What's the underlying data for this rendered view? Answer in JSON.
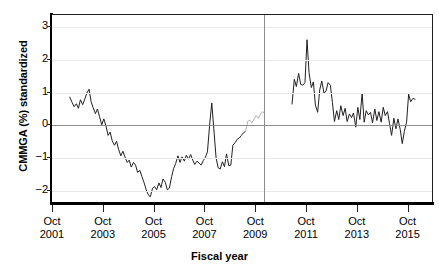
{
  "chart_data": {
    "type": "line",
    "title": "",
    "xlabel": "Fiscal year",
    "ylabel": "CMMGA (%) standardized",
    "grid": true,
    "legend": false,
    "xlim": [
      2001.0,
      2016.0
    ],
    "ylim": [
      -2.35,
      3.35
    ],
    "yticks": [
      -2,
      -1,
      0,
      1,
      2,
      3
    ],
    "ytick_labels": [
      "−2",
      "−1",
      "0",
      "1",
      "2",
      "3"
    ],
    "xticks": [
      2001,
      2003,
      2005,
      2007,
      2009,
      2011,
      2013,
      2015
    ],
    "xtick_labels": [
      {
        "month": "Oct",
        "year": "2001"
      },
      {
        "month": "Oct",
        "year": "2003"
      },
      {
        "month": "Oct",
        "year": "2005"
      },
      {
        "month": "Oct",
        "year": "2007"
      },
      {
        "month": "Oct",
        "year": "2009"
      },
      {
        "month": "Oct",
        "year": "2011"
      },
      {
        "month": "Oct",
        "year": "2013"
      },
      {
        "month": "Oct",
        "year": "2015"
      }
    ],
    "annotations": [
      {
        "name": "interruption-line",
        "type": "vline",
        "x": 2009.35,
        "color": "#8c8c8c"
      }
    ],
    "colors": {
      "series": "#231f20",
      "series_faded": "#b0b0b0",
      "gridline": "#e8e8e8",
      "zero_line": "#8c8c8c",
      "reference_line": "#8c8c8c",
      "axis": "#000000",
      "background": "#ffffff"
    },
    "series": [
      {
        "name": "CMMGA standardized (pre-intervention)",
        "color": "#231f20",
        "x": [
          2001.7,
          2001.79,
          2001.87,
          2001.96,
          2002.04,
          2002.12,
          2002.21,
          2002.29,
          2002.37,
          2002.46,
          2002.54,
          2002.62,
          2002.71,
          2002.79,
          2002.87,
          2002.96,
          2003.04,
          2003.12,
          2003.21,
          2003.29,
          2003.37,
          2003.46,
          2003.54,
          2003.62,
          2003.71,
          2003.79,
          2003.87,
          2003.96,
          2004.04,
          2004.12,
          2004.21,
          2004.29,
          2004.37,
          2004.46,
          2004.54,
          2004.62,
          2004.71,
          2004.79,
          2004.87,
          2004.96,
          2005.04,
          2005.12,
          2005.21,
          2005.29,
          2005.37,
          2005.46,
          2005.54,
          2005.62,
          2005.71,
          2005.79,
          2005.87,
          2005.96,
          2006.04,
          2006.12,
          2006.21,
          2006.29,
          2006.37,
          2006.46,
          2006.54,
          2006.62,
          2006.71,
          2006.79,
          2006.87,
          2006.96,
          2007.04,
          2007.12,
          2007.21,
          2007.29,
          2007.37,
          2007.46,
          2007.54,
          2007.62,
          2007.71,
          2007.79,
          2007.87,
          2007.96,
          2008.04,
          2008.12,
          2008.21,
          2008.29,
          2008.37,
          2008.46,
          2008.54,
          2008.62
        ],
        "y": [
          0.86,
          0.7,
          0.57,
          0.66,
          0.52,
          0.78,
          0.63,
          0.8,
          0.98,
          1.1,
          0.72,
          0.54,
          0.36,
          0.5,
          0.27,
          0.02,
          0.2,
          0.0,
          -0.3,
          -0.2,
          -0.46,
          -0.6,
          -0.48,
          -0.72,
          -0.92,
          -0.78,
          -0.95,
          -1.12,
          -1.05,
          -1.26,
          -1.12,
          -1.2,
          -1.42,
          -1.36,
          -1.55,
          -1.72,
          -1.95,
          -2.1,
          -2.16,
          -1.9,
          -1.85,
          -1.95,
          -1.74,
          -1.88,
          -1.62,
          -1.72,
          -1.95,
          -1.9,
          -1.55,
          -1.3,
          -1.15,
          -0.92,
          -1.12,
          -0.95,
          -1.08,
          -0.9,
          -1.02,
          -0.88,
          -1.05,
          -1.18,
          -1.08,
          -1.14,
          -1.2,
          -1.06,
          -0.96,
          -0.8,
          0.05,
          0.68,
          -0.1,
          -0.98,
          -1.28,
          -1.32,
          -1.1,
          -1.25,
          -0.86,
          -1.22,
          -1.2,
          -0.6,
          -0.52,
          -0.42,
          -0.38,
          -0.3,
          -0.22,
          -0.18
        ]
      },
      {
        "name": "CMMGA standardized (faded transition)",
        "color": "#b0b0b0",
        "x": [
          2008.62,
          2008.71,
          2008.79,
          2008.87,
          2008.96,
          2009.04,
          2009.12,
          2009.21,
          2009.29,
          2009.35
        ],
        "y": [
          -0.18,
          0.13,
          0.16,
          0.08,
          0.2,
          0.3,
          0.22,
          0.34,
          0.42,
          0.38
        ]
      },
      {
        "name": "CMMGA standardized (post-intervention)",
        "color": "#231f20",
        "x": [
          2010.45,
          2010.54,
          2010.62,
          2010.71,
          2010.79,
          2010.87,
          2010.96,
          2011.04,
          2011.12,
          2011.21,
          2011.29,
          2011.37,
          2011.46,
          2011.54,
          2011.62,
          2011.71,
          2011.79,
          2011.87,
          2011.96,
          2012.04,
          2012.12,
          2012.21,
          2012.29,
          2012.37,
          2012.46,
          2012.54,
          2012.62,
          2012.71,
          2012.79,
          2012.87,
          2012.96,
          2013.04,
          2013.12,
          2013.21,
          2013.29,
          2013.37,
          2013.46,
          2013.54,
          2013.62,
          2013.71,
          2013.79,
          2013.87,
          2013.96,
          2014.04,
          2014.12,
          2014.21,
          2014.29,
          2014.37,
          2014.46,
          2014.54,
          2014.62,
          2014.71,
          2014.79,
          2014.87,
          2014.96,
          2015.04,
          2015.12,
          2015.21,
          2015.29
        ],
        "y": [
          0.65,
          1.4,
          1.18,
          1.58,
          1.25,
          1.22,
          1.3,
          2.6,
          1.6,
          1.15,
          1.32,
          0.62,
          0.4,
          1.08,
          1.35,
          0.98,
          1.05,
          1.3,
          1.22,
          0.7,
          0.12,
          0.45,
          0.18,
          0.6,
          0.3,
          0.52,
          0.12,
          0.35,
          0.24,
          0.38,
          -0.05,
          0.55,
          0.18,
          0.98,
          0.1,
          0.45,
          0.32,
          0.4,
          0.08,
          0.5,
          0.15,
          0.42,
          0.1,
          0.55,
          0.3,
          0.42,
          0.05,
          -0.3,
          0.22,
          -0.1,
          0.2,
          -0.12,
          -0.55,
          -0.18,
          0.1,
          0.95,
          0.72,
          0.82,
          0.8
        ]
      }
    ]
  }
}
